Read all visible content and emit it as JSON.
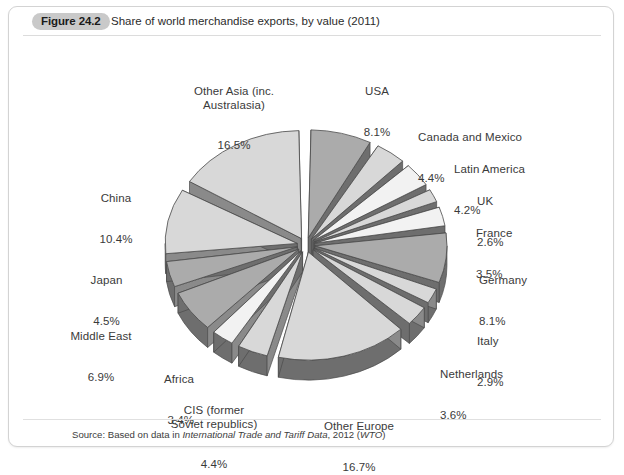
{
  "figure": {
    "badge": "Figure 24.2",
    "title": "Share of world merchandise exports, by value (2011)"
  },
  "source": {
    "prefix": "Source: Based on data in ",
    "italic_title": "International Trade and Tariff Data",
    "middle": ", 2012 (",
    "italic_org": "WTO",
    "suffix": ")"
  },
  "colors": {
    "slice_light": "#d8d8d8",
    "slice_medium": "#ababab",
    "slice_pale": "#f2f2f2",
    "slice_side_dark": "#6e6e6e",
    "slice_side_mid": "#8a8a8a",
    "outline": "#4a4a4a",
    "badge_bg": "#c9c9c9",
    "panel_border": "#d3d3d3",
    "label_text": "#3a3a3a"
  },
  "chart_data": {
    "type": "pie",
    "title": "Share of world merchandise exports, by value (2011)",
    "unit": "%",
    "exploded": true,
    "three_d": true,
    "start_angle_deg": -90,
    "direction": "clockwise",
    "legend": "none",
    "labels_position": "outside-radial",
    "categories": [
      "USA",
      "Canada and Mexico",
      "Latin America",
      "UK",
      "France",
      "Germany",
      "Italy",
      "Netherlands",
      "Other Europe",
      "CIS (former Soviet republics)",
      "Africa",
      "Middle East",
      "Japan",
      "China",
      "Other Asia (inc. Australasia)"
    ],
    "values": [
      8.1,
      4.4,
      4.2,
      2.6,
      3.5,
      8.1,
      2.9,
      3.6,
      16.7,
      4.4,
      3.4,
      6.9,
      4.5,
      10.4,
      16.5
    ],
    "slices": [
      {
        "name": "USA",
        "value": 8.1,
        "label_name": "USA",
        "label_value": "8.1%",
        "fill": "medium"
      },
      {
        "name": "Canada and Mexico",
        "value": 4.4,
        "label_name": "Canada and Mexico",
        "label_value": "4.4%",
        "fill": "light"
      },
      {
        "name": "Latin America",
        "value": 4.2,
        "label_name": "Latin America",
        "label_value": "4.2%",
        "fill": "pale"
      },
      {
        "name": "UK",
        "value": 2.6,
        "label_name": "UK",
        "label_value": "2.6%",
        "fill": "light"
      },
      {
        "name": "France",
        "value": 3.5,
        "label_name": "France",
        "label_value": "3.5%",
        "fill": "pale"
      },
      {
        "name": "Germany",
        "value": 8.1,
        "label_name": "Germany",
        "label_value": "8.1%",
        "fill": "medium"
      },
      {
        "name": "Italy",
        "value": 2.9,
        "label_name": "Italy",
        "label_value": "2.9%",
        "fill": "light"
      },
      {
        "name": "Netherlands",
        "value": 3.6,
        "label_name": "Netherlands",
        "label_value": "3.6%",
        "fill": "light"
      },
      {
        "name": "Other Europe",
        "value": 16.7,
        "label_name": "Other Europe",
        "label_value": "16.7%",
        "fill": "light"
      },
      {
        "name": "CIS (former Soviet republics)",
        "value": 4.4,
        "label_name": "CIS (former\nSoviet republics)",
        "label_value": "4.4%",
        "fill": "light"
      },
      {
        "name": "Africa",
        "value": 3.4,
        "label_name": "Africa",
        "label_value": "3.4%",
        "fill": "pale"
      },
      {
        "name": "Middle East",
        "value": 6.9,
        "label_name": "Middle East",
        "label_value": "6.9%",
        "fill": "medium"
      },
      {
        "name": "Japan",
        "value": 4.5,
        "label_name": "Japan",
        "label_value": "4.5%",
        "fill": "medium"
      },
      {
        "name": "China",
        "value": 10.4,
        "label_name": "China",
        "label_value": "10.4%",
        "fill": "light"
      },
      {
        "name": "Other Asia (inc. Australasia)",
        "value": 16.5,
        "label_name": "Other Asia (inc.\nAustralasia)",
        "label_value": "16.5%",
        "fill": "light"
      }
    ]
  }
}
